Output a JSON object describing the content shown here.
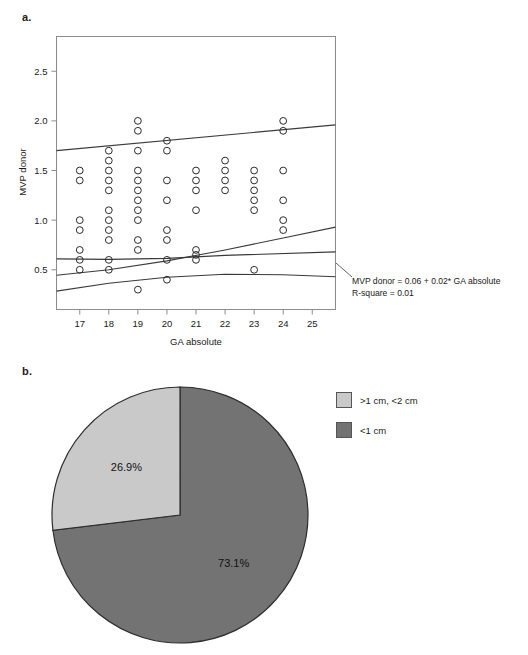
{
  "figure": {
    "panel_a_label": "a.",
    "panel_b_label": "b."
  },
  "chart_data": [
    {
      "id": "scatter",
      "type": "scatter",
      "title": "",
      "xlabel": "GA absolute",
      "ylabel": "MVP donor",
      "xlim": [
        16.2,
        25.8
      ],
      "ylim": [
        0.1,
        2.85
      ],
      "xticks": [
        17,
        18,
        19,
        20,
        21,
        22,
        23,
        24,
        25
      ],
      "yticks": [
        0.5,
        1.0,
        1.5,
        2.0,
        2.5
      ],
      "xtick_labels": [
        "17",
        "18",
        "19",
        "20",
        "21",
        "22",
        "23",
        "24",
        "25"
      ],
      "ytick_labels": [
        "0.5",
        "1.0",
        "1.5",
        "2.0",
        "2.5"
      ],
      "grid": false,
      "marker": "open-circle",
      "points": [
        [
          17,
          1.5
        ],
        [
          17,
          1.4
        ],
        [
          17,
          1.0
        ],
        [
          17,
          0.9
        ],
        [
          17,
          0.7
        ],
        [
          17,
          0.6
        ],
        [
          17,
          0.5
        ],
        [
          18,
          1.7
        ],
        [
          18,
          1.6
        ],
        [
          18,
          1.5
        ],
        [
          18,
          1.4
        ],
        [
          18,
          1.3
        ],
        [
          18,
          1.1
        ],
        [
          18,
          1.0
        ],
        [
          18,
          0.9
        ],
        [
          18,
          0.8
        ],
        [
          18,
          0.6
        ],
        [
          18,
          0.5
        ],
        [
          19,
          2.0
        ],
        [
          19,
          1.9
        ],
        [
          19,
          1.7
        ],
        [
          19,
          1.5
        ],
        [
          19,
          1.4
        ],
        [
          19,
          1.3
        ],
        [
          19,
          1.2
        ],
        [
          19,
          1.1
        ],
        [
          19,
          1.0
        ],
        [
          19,
          0.8
        ],
        [
          19,
          0.7
        ],
        [
          19,
          0.3
        ],
        [
          20,
          1.8
        ],
        [
          20,
          1.7
        ],
        [
          20,
          1.4
        ],
        [
          20,
          1.2
        ],
        [
          20,
          0.9
        ],
        [
          20,
          0.8
        ],
        [
          20,
          0.6
        ],
        [
          20,
          0.4
        ],
        [
          21,
          1.5
        ],
        [
          21,
          1.4
        ],
        [
          21,
          1.3
        ],
        [
          21,
          1.1
        ],
        [
          21,
          0.7
        ],
        [
          21,
          0.65
        ],
        [
          21,
          0.6
        ],
        [
          22,
          1.6
        ],
        [
          22,
          1.5
        ],
        [
          22,
          1.4
        ],
        [
          22,
          1.3
        ],
        [
          23,
          1.5
        ],
        [
          23,
          1.4
        ],
        [
          23,
          1.3
        ],
        [
          23,
          1.2
        ],
        [
          23,
          1.1
        ],
        [
          23,
          0.5
        ],
        [
          24,
          2.0
        ],
        [
          24,
          1.9
        ],
        [
          24,
          1.5
        ],
        [
          24,
          1.2
        ],
        [
          24,
          1.0
        ],
        [
          24,
          0.9
        ]
      ],
      "lines": [
        {
          "name": "upper-confidence-band",
          "points": [
            [
              16.2,
              1.7
            ],
            [
              25.8,
              1.96
            ]
          ]
        },
        {
          "name": "regression-line",
          "points": [
            [
              16.2,
              0.61
            ],
            [
              18.0,
              0.605
            ],
            [
              20.0,
              0.615
            ],
            [
              22.0,
              0.645
            ],
            [
              25.8,
              0.68
            ]
          ]
        },
        {
          "name": "lower-band-upper-curve",
          "points": [
            [
              16.2,
              0.445
            ],
            [
              18.0,
              0.5
            ],
            [
              20.0,
              0.59
            ],
            [
              22.0,
              0.7
            ],
            [
              24.0,
              0.82
            ],
            [
              25.8,
              0.93
            ]
          ]
        },
        {
          "name": "lower-confidence-band",
          "points": [
            [
              16.2,
              0.285
            ],
            [
              18.0,
              0.365
            ],
            [
              20.0,
              0.425
            ],
            [
              22.0,
              0.455
            ],
            [
              24.0,
              0.45
            ],
            [
              25.8,
              0.43
            ]
          ]
        }
      ],
      "annotation": {
        "line1": "MVP donor = 0.06 + 0.02* GA absolute",
        "line2": "R-square = 0.01"
      }
    },
    {
      "id": "pie",
      "type": "pie",
      "title": "",
      "labels": [
        ">1 cm, <2 cm",
        "<1 cm"
      ],
      "values": [
        26.9,
        73.1
      ],
      "value_labels": [
        "26.9%",
        "73.1%"
      ],
      "colors": [
        "#c9c9c9",
        "#737373"
      ],
      "legend_position": "right",
      "start_angle_deg": 0,
      "direction": "clockwise"
    }
  ]
}
